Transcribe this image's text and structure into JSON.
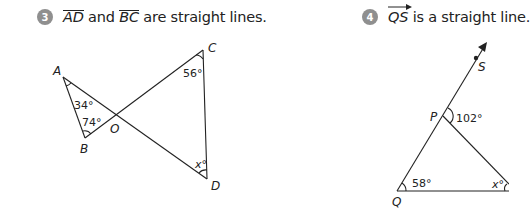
{
  "questions": [
    {
      "number": "3",
      "statement": {
        "segment1": "AD",
        "connector": " and ",
        "segment2": "BC",
        "rest": " are straight lines."
      },
      "figure": {
        "points": {
          "A": "A",
          "B": "B",
          "C": "C",
          "D": "D",
          "O": "O"
        },
        "angles": {
          "A": "34°",
          "B": "74°",
          "C": "56°",
          "D": "x°"
        }
      }
    },
    {
      "number": "4",
      "statement": {
        "ray": "QS",
        "rest": " is a straight line."
      },
      "figure": {
        "points": {
          "P": "P",
          "Q": "Q",
          "S": "S"
        },
        "angles": {
          "P_exterior": "102°",
          "Q": "58°",
          "R": "x°"
        }
      }
    }
  ],
  "colors": {
    "badge": "#8f8f8f",
    "line": "#222222"
  }
}
